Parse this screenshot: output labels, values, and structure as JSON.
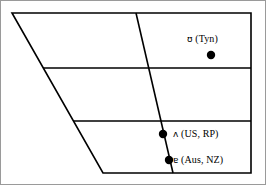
{
  "figure": {
    "name": "vowel-quadrilateral-chart",
    "width": 266,
    "height": 185,
    "background_color": "#ffffff",
    "border_color": "#9a9a9a",
    "line_color": "#000000",
    "dot_color": "#000000"
  },
  "chart_data": {
    "type": "scatter",
    "title": "",
    "subtitle": "",
    "xlabel": "",
    "ylabel": "",
    "grid": true,
    "legend_position": "none",
    "note": "IPA vowel quadrilateral with three plotted vowel qualities labelled by variety",
    "quadrilateral": {
      "points": [
        [
          11,
          12
        ],
        [
          250,
          12
        ],
        [
          250,
          172
        ],
        [
          102,
          172
        ]
      ],
      "description": "trapezoid: flat top, flat bottom, vertical right edge, slanted left edge"
    },
    "horizontal_dividers": [
      {
        "y": 67,
        "x_start": 42,
        "x_end": 250
      },
      {
        "y": 120,
        "x_start": 72,
        "x_end": 250
      }
    ],
    "diagonal_dividers": [
      {
        "x_start": 135,
        "y_start": 12,
        "x_end": 172,
        "y_end": 172
      }
    ],
    "points": [
      {
        "symbol": "ʊ",
        "varieties": "(Tyn)",
        "label": "ʊ (Tyn)",
        "x": 210,
        "y": 54
      },
      {
        "symbol": "ʌ",
        "varieties": "(US, RP)",
        "label": "ʌ (US, RP)",
        "x": 162,
        "y": 133
      },
      {
        "symbol": "ɐ",
        "varieties": "(Aus, NZ)",
        "label": "ɐ (Aus, NZ)",
        "x": 168,
        "y": 159
      }
    ],
    "categories": [
      "Tyn",
      "US, RP",
      "Aus, NZ"
    ],
    "values": [
      {
        "name": "Tyn",
        "symbol": "ʊ"
      },
      {
        "name": "US, RP",
        "symbol": "ʌ"
      },
      {
        "name": "Aus, NZ",
        "symbol": "ɐ"
      }
    ]
  },
  "labels": {
    "tyn": {
      "ipa": "ʊ",
      "text": " (Tyn)"
    },
    "usrp": {
      "ipa": "ʌ",
      "text": " (US, RP)"
    },
    "ausnz": {
      "ipa": "ɐ",
      "text": " (Aus, NZ)"
    }
  }
}
